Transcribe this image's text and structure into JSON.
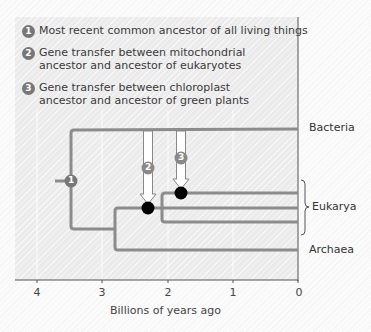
{
  "legend": {
    "items": [
      {
        "num": "1",
        "text": "Most recent common ancestor of all living things"
      },
      {
        "num": "2",
        "text": "Gene transfer between mitochondrial ancestor and ancestor of eukaryotes"
      },
      {
        "num": "3",
        "text": "Gene transfer between chloroplast ancestor and ancestor of green plants"
      }
    ]
  },
  "tree": {
    "leaves": {
      "bacteria": "Bacteria",
      "eukarya": "Eukarya",
      "archaea": "Archaea"
    },
    "markers": {
      "node1": "1",
      "arrow2": "2",
      "arrow3": "3"
    },
    "colors": {
      "branch": "#8c8c8c",
      "node": "#000000",
      "marker": "#777777"
    }
  },
  "axis": {
    "title": "Billions of years ago",
    "ticks": [
      "4",
      "3",
      "2",
      "1",
      "0"
    ]
  }
}
